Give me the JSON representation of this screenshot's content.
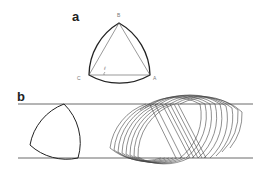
{
  "figure": {
    "panel_a": {
      "label": "a",
      "vertices": {
        "top": "B",
        "left": "C",
        "right": "A"
      },
      "angle_label": "ℓ"
    },
    "panel_b": {
      "label": "b"
    }
  },
  "colors": {
    "stroke": "#333333",
    "thin_stroke": "#555555",
    "label": "#222222"
  }
}
